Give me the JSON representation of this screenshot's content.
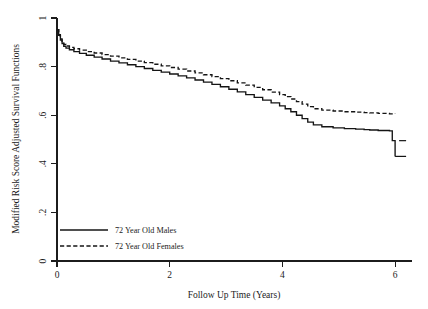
{
  "chart_data": {
    "type": "line",
    "title": "",
    "subtitle": "",
    "xlabel": "Follow Up Time (Years)",
    "ylabel": "Modified Risk Score Adjusted Survival Functions",
    "xlim": [
      0,
      6.3
    ],
    "ylim": [
      0,
      1.05
    ],
    "xticks": [
      0,
      2,
      4,
      6
    ],
    "xticklabels": [
      "0",
      "2",
      "4",
      "6"
    ],
    "yticks": [
      0,
      0.2,
      0.4,
      0.6,
      0.8,
      1
    ],
    "yticklabels": [
      "0",
      ".2",
      ".4",
      ".6",
      ".8",
      "1"
    ],
    "grid": false,
    "legend_position": "lower-left-inside",
    "legend": [
      "72 Year Old Males",
      "72 Year Old Females"
    ],
    "series": [
      {
        "name": "72 Year Old Males",
        "style": "solid",
        "color": "#141414",
        "x": [
          0.0,
          0.03,
          0.06,
          0.09,
          0.12,
          0.16,
          0.22,
          0.3,
          0.4,
          0.52,
          0.66,
          0.8,
          0.95,
          1.1,
          1.25,
          1.4,
          1.55,
          1.7,
          1.85,
          2.0,
          2.15,
          2.3,
          2.45,
          2.6,
          2.75,
          2.9,
          3.05,
          3.2,
          3.35,
          3.5,
          3.65,
          3.8,
          3.95,
          4.05,
          4.15,
          4.25,
          4.35,
          4.45,
          4.55,
          4.7,
          4.9,
          5.1,
          5.3,
          5.45,
          5.55,
          5.7,
          5.9,
          5.95,
          6.0
        ],
        "y": [
          1.0,
          0.975,
          0.955,
          0.94,
          0.928,
          0.92,
          0.913,
          0.905,
          0.897,
          0.889,
          0.881,
          0.873,
          0.864,
          0.856,
          0.848,
          0.84,
          0.832,
          0.824,
          0.816,
          0.808,
          0.8,
          0.791,
          0.782,
          0.773,
          0.763,
          0.753,
          0.742,
          0.731,
          0.719,
          0.707,
          0.695,
          0.683,
          0.67,
          0.658,
          0.645,
          0.63,
          0.615,
          0.6,
          0.588,
          0.58,
          0.575,
          0.572,
          0.57,
          0.568,
          0.566,
          0.564,
          0.562,
          0.52,
          0.452
        ]
      },
      {
        "name": "72 Year Old Females",
        "style": "dashed",
        "color": "#141414",
        "x": [
          0.0,
          0.03,
          0.06,
          0.09,
          0.12,
          0.16,
          0.22,
          0.3,
          0.4,
          0.52,
          0.66,
          0.8,
          0.95,
          1.1,
          1.25,
          1.4,
          1.55,
          1.7,
          1.85,
          2.0,
          2.15,
          2.3,
          2.45,
          2.6,
          2.75,
          2.9,
          3.05,
          3.2,
          3.35,
          3.5,
          3.65,
          3.8,
          3.95,
          4.05,
          4.15,
          4.25,
          4.35,
          4.45,
          4.55,
          4.7,
          4.9,
          5.1,
          5.3,
          5.45,
          5.55,
          5.7,
          5.9,
          6.0
        ],
        "y": [
          1.0,
          0.978,
          0.96,
          0.946,
          0.936,
          0.929,
          0.923,
          0.917,
          0.911,
          0.905,
          0.899,
          0.892,
          0.885,
          0.878,
          0.871,
          0.864,
          0.857,
          0.85,
          0.843,
          0.836,
          0.829,
          0.821,
          0.813,
          0.805,
          0.797,
          0.788,
          0.779,
          0.77,
          0.76,
          0.75,
          0.74,
          0.73,
          0.719,
          0.71,
          0.7,
          0.689,
          0.678,
          0.667,
          0.658,
          0.652,
          0.648,
          0.645,
          0.643,
          0.641,
          0.64,
          0.638,
          0.636,
          0.635
        ]
      }
    ],
    "annotations": [
      {
        "kind": "censor-tick",
        "series": "72 Year Old Males",
        "x": 6.0,
        "y_top": 0.52,
        "y_bottom": 0.452
      }
    ]
  }
}
